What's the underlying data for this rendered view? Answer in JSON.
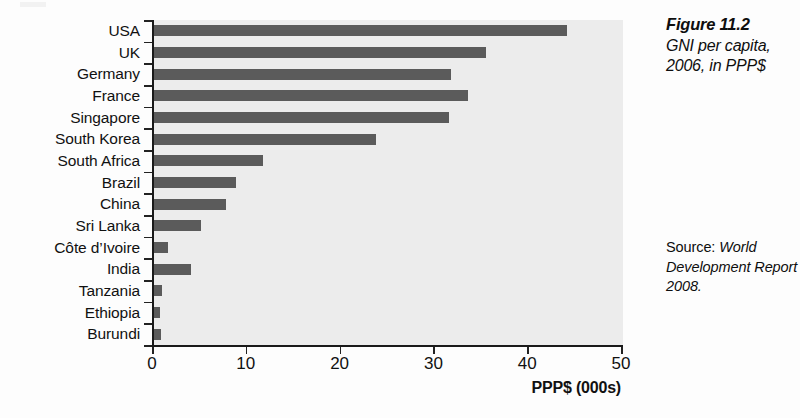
{
  "figure": {
    "number": "Figure 11.2",
    "caption": "GNI per capita, 2006, in PPP$",
    "source_label": "Source: ",
    "source_work": "World Development Report 2008."
  },
  "chart_data": {
    "type": "bar",
    "orientation": "horizontal",
    "title": "GNI per capita, 2006, in PPP$",
    "xlabel": "PPP$ (000s)",
    "ylabel": "",
    "xlim": [
      0,
      50
    ],
    "xticks": [
      0,
      10,
      20,
      30,
      40,
      50
    ],
    "xtick_labels": [
      "0",
      "10",
      "20",
      "30",
      "40",
      "50"
    ],
    "grid": false,
    "legend": false,
    "bar_color": "#5b5b5b",
    "plot_background": "#ececec",
    "categories": [
      "USA",
      "UK",
      "Germany",
      "France",
      "Singapore",
      "South Korea",
      "South Africa",
      "Brazil",
      "China",
      "Sri Lanka",
      "Côte d’Ivoire",
      "India",
      "Tanzania",
      "Ethiopia",
      "Burundi"
    ],
    "values": [
      44.0,
      35.4,
      31.7,
      33.5,
      31.5,
      23.7,
      11.6,
      8.7,
      7.7,
      5.0,
      1.5,
      3.9,
      0.9,
      0.6,
      0.7
    ],
    "units": "thousands of PPP$"
  }
}
